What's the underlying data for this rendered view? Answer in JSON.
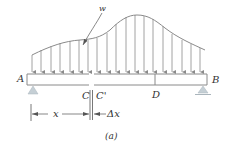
{
  "figure": {
    "caption": "(a)",
    "load_label": "w",
    "labels": {
      "left_support": "A",
      "right_support": "B",
      "section_left": "C",
      "section_right": "C'",
      "point_d": "D",
      "dim_x": "x",
      "dim_dx": "Δx"
    },
    "colors": {
      "line": "#8a8a8a",
      "beam_fill": "#ffffff",
      "support": "#b8c4cc",
      "text": "#333333"
    }
  }
}
